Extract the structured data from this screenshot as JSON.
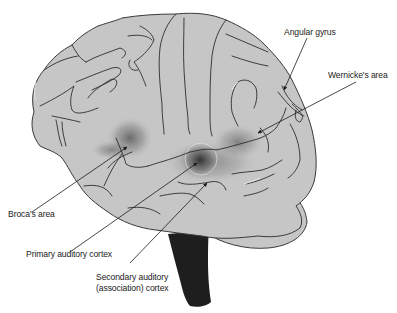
{
  "diagram": {
    "labels": {
      "angular_gyrus": "Angular gyrus",
      "wernickes_area": "Wernicke's area",
      "brocas_area": "Broca's area",
      "primary_auditory_cortex": "Primary auditory cortex",
      "secondary_auditory_line1": "Secondary auditory",
      "secondary_auditory_line2": "(association) cortex"
    },
    "colors": {
      "brain_fill": "#c6c6c6",
      "outline": "#3a3a3a",
      "highlight_dark": "#555555",
      "brainstem": "#1e1e1e",
      "background": "#ffffff",
      "text": "#222222"
    }
  }
}
